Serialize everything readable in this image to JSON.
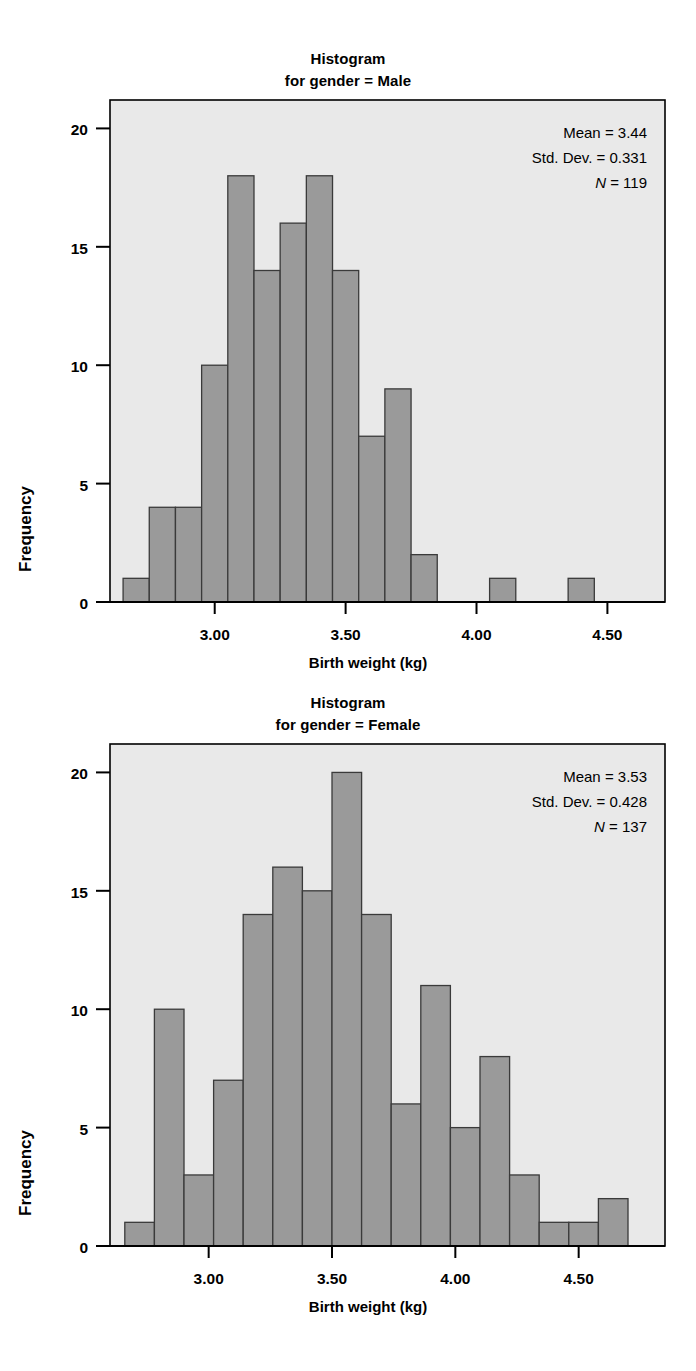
{
  "figure": {
    "axis_label_x": "Birth weight (kg)",
    "axis_label_y": "Frequency"
  },
  "panels": [
    {
      "title_line1": "Histogram",
      "title_line2": "for gender = Male",
      "stats": {
        "mean_label": "Mean = 3.44",
        "sd_label": "Std. Dev. = 0.331",
        "n_italic": "N",
        "n_rest": " = 119"
      }
    },
    {
      "title_line1": "Histogram",
      "title_line2": "for gender = Female",
      "stats": {
        "mean_label": "Mean = 3.53",
        "sd_label": "Std. Dev. = 0.428",
        "n_italic": "N",
        "n_rest": " = 137"
      }
    }
  ],
  "colors": {
    "plot_background": "#e9e9e9",
    "bar_fill": "#9a9a9a",
    "bar_stroke": "#3a3a3a",
    "axis": "#000000",
    "page_background": "#ffffff"
  },
  "chart_data": [
    {
      "type": "bar",
      "title": "Histogram for gender = Male",
      "xlabel": "Birth weight (kg)",
      "ylabel": "Frequency",
      "ylim": [
        0,
        21.2
      ],
      "yticks": [
        0,
        5,
        10,
        15,
        20
      ],
      "ytick_labels": [
        "0",
        "5",
        "10",
        "15",
        "20"
      ],
      "xlim": [
        2.6,
        4.72
      ],
      "xticks": [
        3.0,
        3.5,
        4.0,
        4.5
      ],
      "xtick_labels": [
        "3.00",
        "3.50",
        "4.00",
        "4.50"
      ],
      "grid": false,
      "legend": "none",
      "bin_width": 0.1,
      "bin_starts": [
        2.65,
        2.75,
        2.85,
        2.95,
        3.05,
        3.15,
        3.25,
        3.35,
        3.45,
        3.55,
        3.65,
        3.75,
        3.85,
        3.95,
        4.25,
        4.55
      ],
      "categories": [
        "2.65-2.75",
        "2.75-2.85",
        "2.85-2.95",
        "2.95-3.05",
        "3.05-3.15",
        "3.15-3.25",
        "3.25-3.35",
        "3.35-3.45",
        "3.45-3.55",
        "3.55-3.65",
        "3.65-3.75",
        "3.75-3.85",
        "3.85-3.95",
        "3.95-4.05",
        "4.25-4.35",
        "4.55-4.65"
      ],
      "values": [
        1,
        4,
        4,
        10,
        18,
        14,
        16,
        18,
        14,
        7,
        9,
        2,
        1,
        1
      ],
      "bars": [
        {
          "x0": 2.65,
          "x1": 2.75,
          "v": 1
        },
        {
          "x0": 2.75,
          "x1": 2.85,
          "v": 4
        },
        {
          "x0": 2.85,
          "x1": 2.95,
          "v": 4
        },
        {
          "x0": 2.95,
          "x1": 3.05,
          "v": 10
        },
        {
          "x0": 3.05,
          "x1": 3.15,
          "v": 18
        },
        {
          "x0": 3.15,
          "x1": 3.25,
          "v": 14
        },
        {
          "x0": 3.25,
          "x1": 3.35,
          "v": 16
        },
        {
          "x0": 3.35,
          "x1": 3.45,
          "v": 18
        },
        {
          "x0": 3.45,
          "x1": 3.55,
          "v": 14
        },
        {
          "x0": 3.55,
          "x1": 3.65,
          "v": 7
        },
        {
          "x0": 3.65,
          "x1": 3.75,
          "v": 9
        },
        {
          "x0": 3.75,
          "x1": 3.85,
          "v": 2
        },
        {
          "x0": 4.05,
          "x1": 4.15,
          "v": 1
        },
        {
          "x0": 4.35,
          "x1": 4.45,
          "v": 1
        }
      ],
      "annotations": [
        "Mean = 3.44",
        "Std. Dev. = 0.331",
        "N = 119"
      ],
      "mean": 3.44,
      "std_dev": 0.331,
      "n": 119
    },
    {
      "type": "bar",
      "title": "Histogram for gender = Female",
      "xlabel": "Birth weight (kg)",
      "ylabel": "Frequency",
      "ylim": [
        0,
        21.2
      ],
      "yticks": [
        0,
        5,
        10,
        15,
        20
      ],
      "ytick_labels": [
        "0",
        "5",
        "10",
        "15",
        "20"
      ],
      "xlim": [
        2.6,
        4.85
      ],
      "xticks": [
        3.0,
        3.5,
        4.0,
        4.5
      ],
      "xtick_labels": [
        "3.00",
        "3.50",
        "4.00",
        "4.50"
      ],
      "grid": false,
      "legend": "none",
      "bin_width": 0.12,
      "categories": [
        "2.66-2.78",
        "2.78-2.90",
        "2.90-3.02",
        "3.02-3.14",
        "3.14-3.26",
        "3.26-3.38",
        "3.38-3.50",
        "3.50-3.62",
        "3.62-3.74",
        "3.74-3.86",
        "3.86-3.98",
        "3.98-4.10",
        "4.10-4.22",
        "4.22-4.34",
        "4.34-4.46",
        "4.46-4.58",
        "4.58-4.70"
      ],
      "values": [
        1,
        10,
        3,
        7,
        14,
        16,
        15,
        20,
        14,
        6,
        11,
        5,
        8,
        3,
        1,
        1,
        2
      ],
      "bars": [
        {
          "x0": 2.66,
          "x1": 2.78,
          "v": 1
        },
        {
          "x0": 2.78,
          "x1": 2.9,
          "v": 10
        },
        {
          "x0": 2.9,
          "x1": 3.02,
          "v": 3
        },
        {
          "x0": 3.02,
          "x1": 3.14,
          "v": 7
        },
        {
          "x0": 3.14,
          "x1": 3.26,
          "v": 14
        },
        {
          "x0": 3.26,
          "x1": 3.38,
          "v": 16
        },
        {
          "x0": 3.38,
          "x1": 3.5,
          "v": 15
        },
        {
          "x0": 3.5,
          "x1": 3.62,
          "v": 20
        },
        {
          "x0": 3.62,
          "x1": 3.74,
          "v": 14
        },
        {
          "x0": 3.74,
          "x1": 3.86,
          "v": 6
        },
        {
          "x0": 3.86,
          "x1": 3.98,
          "v": 11
        },
        {
          "x0": 3.98,
          "x1": 4.1,
          "v": 5
        },
        {
          "x0": 4.1,
          "x1": 4.22,
          "v": 8
        },
        {
          "x0": 4.22,
          "x1": 4.34,
          "v": 3
        },
        {
          "x0": 4.34,
          "x1": 4.46,
          "v": 1
        },
        {
          "x0": 4.46,
          "x1": 4.58,
          "v": 1
        },
        {
          "x0": 4.58,
          "x1": 4.7,
          "v": 2
        }
      ],
      "annotations": [
        "Mean = 3.53",
        "Std. Dev. = 0.428",
        "N = 137"
      ],
      "mean": 3.53,
      "std_dev": 0.428,
      "n": 137
    }
  ]
}
